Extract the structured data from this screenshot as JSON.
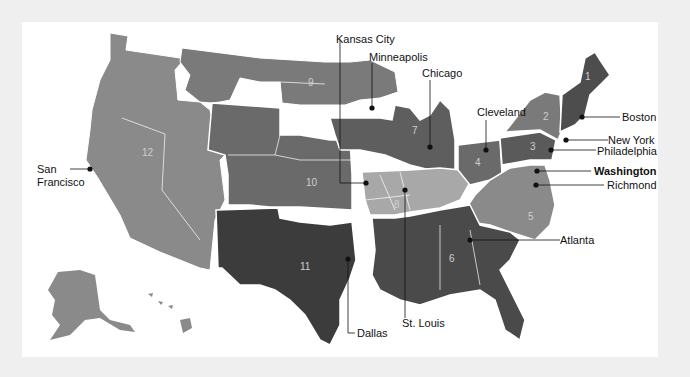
{
  "map": {
    "title": "Federal Reserve Districts",
    "colors": {
      "background": "#efefef",
      "panel": "#ffffff",
      "district_mid": "#7a7a7a",
      "district_dark": "#4d4d4d",
      "district_darker": "#3c3c3c",
      "district_light": "#a8a8a8",
      "district_western": "#8a8a8a",
      "border": "#ffffff",
      "text": "#111111"
    },
    "districts": [
      {
        "number": "1",
        "name": "Boston"
      },
      {
        "number": "2",
        "name": "New York"
      },
      {
        "number": "3",
        "name": "Philadelphia"
      },
      {
        "number": "4",
        "name": "Cleveland"
      },
      {
        "number": "5",
        "name": "Richmond"
      },
      {
        "number": "6",
        "name": "Atlanta"
      },
      {
        "number": "7",
        "name": "Chicago"
      },
      {
        "number": "8",
        "name": "St. Louis"
      },
      {
        "number": "9",
        "name": "Minneapolis"
      },
      {
        "number": "10",
        "name": "Kansas City"
      },
      {
        "number": "11",
        "name": "Dallas"
      },
      {
        "number": "12",
        "name": "San Francisco"
      }
    ],
    "cities": {
      "kansas_city": "Kansas City",
      "minneapolis": "Minneapolis",
      "chicago": "Chicago",
      "cleveland": "Cleveland",
      "boston": "Boston",
      "new_york": "New York",
      "philadelphia": "Philadelphia",
      "washington": "Washington",
      "richmond": "Richmond",
      "atlanta": "Atlanta",
      "st_louis": "St. Louis",
      "dallas": "Dallas",
      "san_francisco_line1": "San",
      "san_francisco_line2": "Francisco"
    }
  }
}
